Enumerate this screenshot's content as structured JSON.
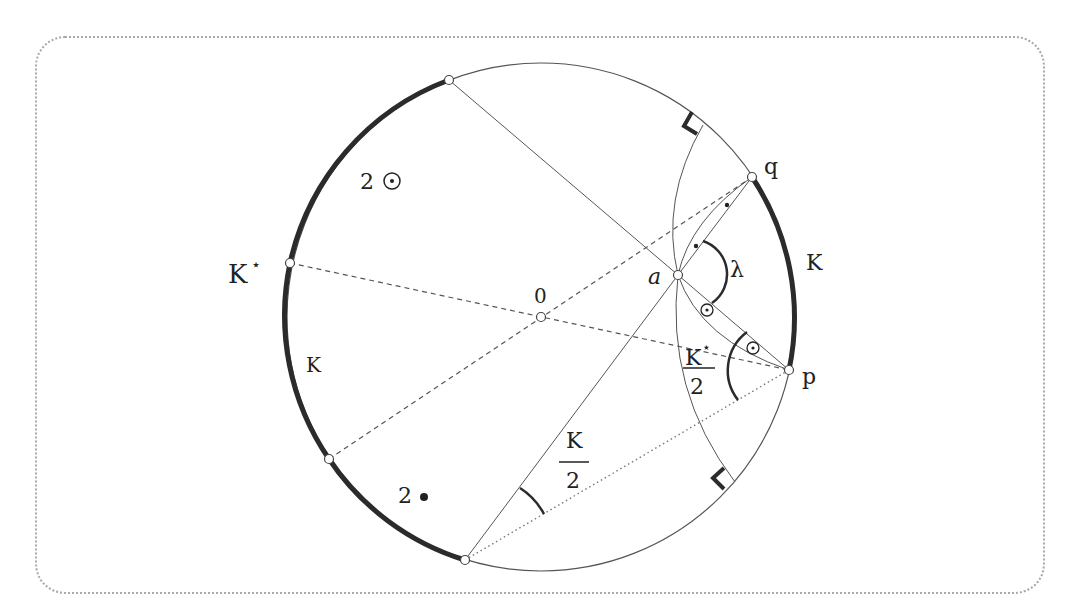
{
  "diagram": {
    "circle": {
      "center": [
        541,
        317
      ],
      "radius": 254
    },
    "points": {
      "center": {
        "label": "0",
        "xy": [
          541,
          317
        ]
      },
      "a": {
        "label": "a",
        "xy": [
          678,
          275
        ]
      },
      "q": {
        "label": "q",
        "xy": [
          752,
          177
        ]
      },
      "p": {
        "label": "p",
        "xy": [
          789,
          370
        ]
      },
      "top": {
        "xy": [
          449,
          80
        ]
      },
      "kstar": {
        "xy": [
          290,
          263
        ]
      },
      "lowleft": {
        "xy": [
          329,
          459
        ]
      },
      "bottom": {
        "xy": [
          465,
          560
        ]
      }
    },
    "labels": {
      "two_odot": "2",
      "kstar": "K",
      "kstar_sup": "⋆",
      "k_left": "K",
      "k_right": "K",
      "zero": "0",
      "a": "a",
      "q": "q",
      "p": "p",
      "lambda": "λ",
      "two_bullet": "2",
      "frac_k_num": "K",
      "frac_k_den": "2",
      "frac_kstar_num": "K",
      "frac_kstar_sup": "⋆",
      "frac_kstar_den": "2"
    },
    "colors": {
      "stroke": "#4a4a4a",
      "thick": "#2b2b2b",
      "frame": "#a8a8a8"
    }
  }
}
